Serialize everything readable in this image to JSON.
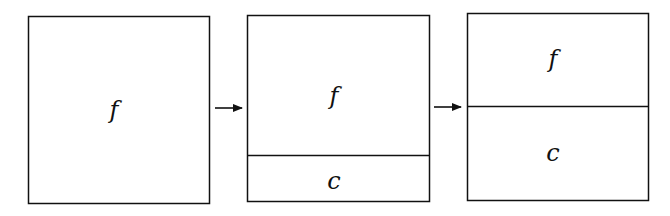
{
  "diagram": {
    "panels": [
      {
        "id": "panel-1",
        "regions": [
          {
            "label": "f"
          }
        ]
      },
      {
        "id": "panel-2",
        "regions": [
          {
            "label": "f"
          },
          {
            "label": "c"
          }
        ]
      },
      {
        "id": "panel-3",
        "regions": [
          {
            "label": "f"
          },
          {
            "label": "c"
          }
        ]
      }
    ],
    "arrows": [
      {
        "from": "panel-1",
        "to": "panel-2"
      },
      {
        "from": "panel-2",
        "to": "panel-3"
      }
    ],
    "colors": {
      "stroke": "#111111",
      "background": "#ffffff"
    }
  }
}
